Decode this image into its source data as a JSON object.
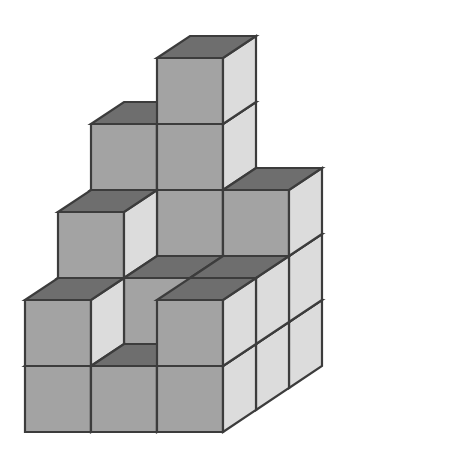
{
  "figure": {
    "kind": "isometric-block-structure",
    "background_color": "#ffffff",
    "canvas": {
      "width": 449,
      "height": 465
    }
  },
  "palette": {
    "top_face": "#6e6e6e",
    "left_face": "#a3a3a3",
    "right_face": "#dcdcdc",
    "outline": "#3c3c3c",
    "outline_width": 2.2
  },
  "projection": {
    "cube_width": 66,
    "cube_height": 66,
    "depth_dx": 33,
    "depth_dy": -22,
    "origin_x": 25,
    "origin_y": 432,
    "rows": 3,
    "cols": 3
  },
  "structure": {
    "description": "3 by 3 footprint of stacked unit cubes seen from above-left; column heights in cubes",
    "row_labels": [
      "front",
      "middle",
      "back"
    ],
    "col_labels": [
      "left",
      "center",
      "right"
    ],
    "height_map": [
      [
        2,
        1,
        2
      ],
      [
        3,
        2,
        2
      ],
      [
        4,
        5,
        3
      ]
    ],
    "columns": [
      {
        "row": 0,
        "col": 0,
        "height": 2,
        "name": "front-left-column"
      },
      {
        "row": 0,
        "col": 1,
        "height": 1,
        "name": "front-center-column"
      },
      {
        "row": 0,
        "col": 2,
        "height": 2,
        "name": "front-right-column"
      },
      {
        "row": 1,
        "col": 0,
        "height": 3,
        "name": "middle-left-column"
      },
      {
        "row": 1,
        "col": 1,
        "height": 2,
        "name": "middle-center-column"
      },
      {
        "row": 1,
        "col": 2,
        "height": 2,
        "name": "middle-right-column"
      },
      {
        "row": 2,
        "col": 0,
        "height": 4,
        "name": "back-left-column"
      },
      {
        "row": 2,
        "col": 1,
        "height": 5,
        "name": "back-center-column"
      },
      {
        "row": 2,
        "col": 2,
        "height": 3,
        "name": "back-right-column"
      }
    ],
    "total_cubes": 24,
    "max_height": 5,
    "min_height": 1
  }
}
